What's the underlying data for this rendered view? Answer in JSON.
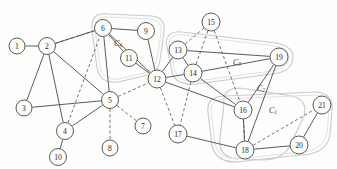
{
  "figure": {
    "name": "graph-clustering-diagram",
    "width": 337,
    "height": 169,
    "background": "#fdfdfc"
  },
  "style": {
    "node_fill": "#fcfcfb",
    "node_stroke": "#4a4a4a",
    "edge_solid_color": "#4a4a4a",
    "edge_dashed_color": "#5a5a5a",
    "hull_color": "#c9c9c9",
    "label_color": "#2a2a2a"
  },
  "nodes": [
    {
      "id": "1",
      "label": "1",
      "x": 17,
      "y": 46,
      "r": 8
    },
    {
      "id": "2",
      "label": "2",
      "x": 47,
      "y": 46,
      "r": 8.5
    },
    {
      "id": "3",
      "label": "3",
      "x": 24,
      "y": 108,
      "r": 8
    },
    {
      "id": "4",
      "label": "4",
      "x": 65,
      "y": 131,
      "r": 8.5
    },
    {
      "id": "5",
      "label": "5",
      "x": 110,
      "y": 100,
      "r": 8.5
    },
    {
      "id": "6",
      "label": "6",
      "x": 103,
      "y": 28,
      "r": 8.5
    },
    {
      "id": "7",
      "label": "7",
      "x": 143,
      "y": 126,
      "r": 8
    },
    {
      "id": "8",
      "label": "8",
      "x": 110,
      "y": 148,
      "r": 8
    },
    {
      "id": "9",
      "label": "9",
      "x": 146,
      "y": 31,
      "r": 8.5
    },
    {
      "id": "10",
      "label": "10",
      "x": 58,
      "y": 157,
      "r": 8.5
    },
    {
      "id": "11",
      "label": "11",
      "x": 129,
      "y": 58,
      "r": 8.5
    },
    {
      "id": "12",
      "label": "12",
      "x": 157,
      "y": 79,
      "r": 9
    },
    {
      "id": "13",
      "label": "13",
      "x": 178,
      "y": 50,
      "r": 9
    },
    {
      "id": "14",
      "label": "14",
      "x": 193,
      "y": 73,
      "r": 9
    },
    {
      "id": "15",
      "label": "15",
      "x": 211,
      "y": 22,
      "r": 9
    },
    {
      "id": "16",
      "label": "16",
      "x": 243,
      "y": 110,
      "r": 9
    },
    {
      "id": "17",
      "label": "17",
      "x": 178,
      "y": 134,
      "r": 9
    },
    {
      "id": "18",
      "label": "18",
      "x": 245,
      "y": 150,
      "r": 9
    },
    {
      "id": "19",
      "label": "19",
      "x": 279,
      "y": 57,
      "r": 9
    },
    {
      "id": "20",
      "label": "20",
      "x": 299,
      "y": 145,
      "r": 9
    },
    {
      "id": "21",
      "label": "21",
      "x": 322,
      "y": 105,
      "r": 9
    }
  ],
  "edges_solid": [
    {
      "from": "1",
      "to": "2"
    },
    {
      "from": "2",
      "to": "3"
    },
    {
      "from": "2",
      "to": "4"
    },
    {
      "from": "2",
      "to": "5"
    },
    {
      "from": "2",
      "to": "6"
    },
    {
      "from": "3",
      "to": "5"
    },
    {
      "from": "4",
      "to": "5"
    },
    {
      "from": "4",
      "to": "10"
    },
    {
      "from": "5",
      "to": "6"
    },
    {
      "from": "6",
      "to": "9"
    },
    {
      "from": "6",
      "to": "11"
    },
    {
      "from": "6",
      "to": "12"
    },
    {
      "from": "9",
      "to": "12"
    },
    {
      "from": "11",
      "to": "12"
    },
    {
      "from": "12",
      "to": "13"
    },
    {
      "from": "12",
      "to": "14"
    },
    {
      "from": "13",
      "to": "14"
    },
    {
      "from": "13",
      "to": "19"
    },
    {
      "from": "14",
      "to": "19"
    },
    {
      "from": "14",
      "to": "16"
    },
    {
      "from": "16",
      "to": "18"
    },
    {
      "from": "16",
      "to": "19"
    },
    {
      "from": "17",
      "to": "18"
    },
    {
      "from": "18",
      "to": "19"
    },
    {
      "from": "18",
      "to": "20"
    },
    {
      "from": "20",
      "to": "21"
    },
    {
      "from": "12",
      "to": "16"
    }
  ],
  "edges_dashed": [
    {
      "from": "2",
      "to": "6"
    },
    {
      "from": "5",
      "to": "7"
    },
    {
      "from": "5",
      "to": "8"
    },
    {
      "from": "5",
      "to": "12"
    },
    {
      "from": "12",
      "to": "17"
    },
    {
      "from": "13",
      "to": "15"
    },
    {
      "from": "14",
      "to": "15"
    },
    {
      "from": "15",
      "to": "16"
    },
    {
      "from": "14",
      "to": "17"
    },
    {
      "from": "16",
      "to": "18"
    },
    {
      "from": "18",
      "to": "21"
    },
    {
      "from": "4",
      "to": "6"
    }
  ],
  "clusters": [
    {
      "id": "C4",
      "label": "C",
      "subscript": "4",
      "label_x": 118,
      "label_y": 43
    },
    {
      "id": "C3",
      "label": "C",
      "subscript": "3",
      "label_x": 237,
      "label_y": 62
    },
    {
      "id": "C2",
      "label": "C",
      "subscript": "2",
      "label_x": 261,
      "label_y": 88
    },
    {
      "id": "C1",
      "label": "C",
      "subscript": "1",
      "label_x": 273,
      "label_y": 110
    }
  ],
  "hulls": [
    {
      "id": "hull-c4",
      "path": "M 92,30 Q 90,12 108,14 L 152,16 Q 166,18 164,32 L 160,60 Q 158,74 144,76 L 118,82 Q 100,84 97,68 Z"
    },
    {
      "id": "hull-c4-inner",
      "path": "M 95,30 Q 93,15 109,17 L 151,19 Q 163,21 161,33 L 157,59 Q 155,71 143,73 L 119,79 Q 103,81 100,67 Z"
    },
    {
      "id": "hull-c3",
      "path": "M 166,42 Q 168,30 182,32 L 268,42 Q 294,44 293,58 Q 292,72 272,74 L 196,84 Q 176,86 172,72 Z"
    },
    {
      "id": "hull-c3-inner",
      "path": "M 169,43 Q 171,33 183,35 L 267,45 Q 290,47 289,58 Q 288,69 271,71 L 197,81 Q 179,83 175,71 Z"
    },
    {
      "id": "hull-c2",
      "path": "M 224,104 Q 222,88 240,88 L 292,96 Q 308,100 304,116 L 290,146 Q 282,160 262,160 L 232,158 Q 218,154 220,138 Z"
    },
    {
      "id": "hull-c1",
      "path": "M 208,112 Q 206,96 226,96 L 316,92 Q 334,94 332,110 L 330,134 Q 328,150 310,154 L 236,162 Q 216,162 212,146 Z"
    },
    {
      "id": "hull-c1-inner",
      "path": "M 211,112 Q 209,99 227,99 L 315,95 Q 331,97 329,110 L 327,133 Q 325,147 309,151 L 237,159 Q 219,159 215,145 Z"
    }
  ]
}
